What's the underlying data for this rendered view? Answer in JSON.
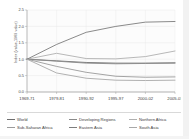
{
  "chart_data": {
    "type": "line",
    "title": "",
    "xlabel": "",
    "ylabel": "Index (value,1969 value)",
    "categories": [
      "1969-71",
      "1979-81",
      "1990-92",
      "1995-97",
      "2000-02",
      "2005-07"
    ],
    "ylim": [
      0.0,
      2.5
    ],
    "yticks": [
      "0.0",
      "0.5",
      "1.0",
      "1.5",
      "2.0",
      "2.5"
    ],
    "ytick_values": [
      0.0,
      0.5,
      1.0,
      1.5,
      2.0,
      2.5
    ],
    "grid": true,
    "legend_position": "bottom",
    "series": [
      {
        "name": "World",
        "color": "#6e6e6e",
        "values": [
          1.0,
          0.95,
          0.9,
          0.88,
          0.88,
          0.89
        ]
      },
      {
        "name": "Developing Regions",
        "color": "#8a8a8a",
        "values": [
          1.0,
          0.94,
          0.88,
          0.86,
          0.87,
          0.88
        ]
      },
      {
        "name": "Northern Africa",
        "color": "#b0b0b0",
        "values": [
          1.0,
          1.18,
          1.02,
          1.01,
          1.08,
          1.25
        ]
      },
      {
        "name": "Sub-Saharan Africa",
        "color": "#9a9a9a",
        "values": [
          1.0,
          0.78,
          0.6,
          0.48,
          0.45,
          0.46
        ]
      },
      {
        "name": "Eastern Asia",
        "color": "#7d7d7d",
        "values": [
          1.0,
          1.45,
          1.82,
          2.0,
          2.13,
          2.15
        ]
      },
      {
        "name": "South Asia",
        "color": "#a8a8a8",
        "values": [
          1.0,
          0.58,
          0.42,
          0.36,
          0.35,
          0.36
        ]
      }
    ]
  },
  "legend": {
    "items": [
      {
        "label": "World"
      },
      {
        "label": "Developing Regions"
      },
      {
        "label": "Northern Africa"
      },
      {
        "label": "Sub-Saharan Africa"
      },
      {
        "label": "Eastern Asia"
      },
      {
        "label": "South Asia"
      }
    ]
  }
}
